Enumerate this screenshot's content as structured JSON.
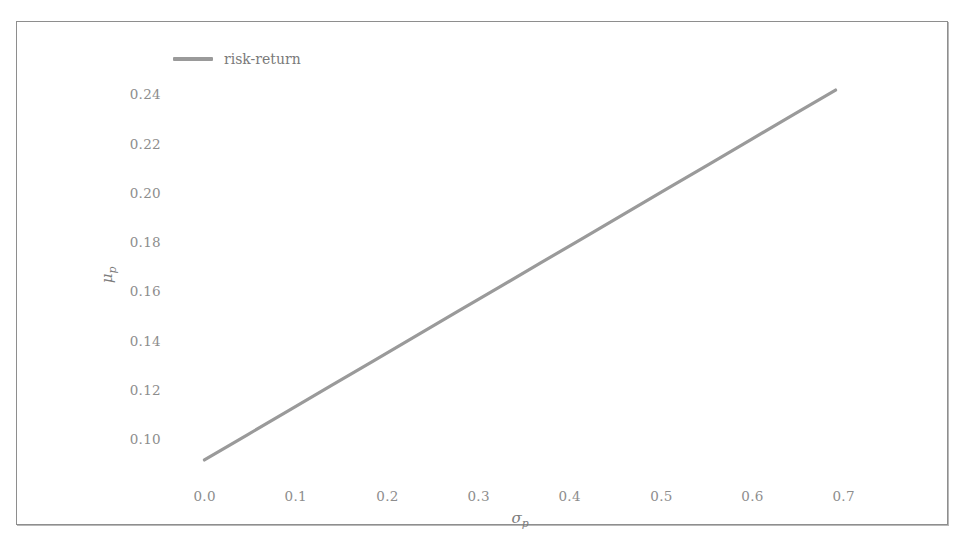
{
  "figure": {
    "background_color": "#ffffff",
    "frame_color": "#8e8e8e"
  },
  "chart_data": {
    "type": "line",
    "title": "",
    "xlabel": "σ",
    "xlabel_sub": "p",
    "ylabel": "μ",
    "ylabel_sub": "p",
    "xlim": [
      -0.035,
      0.785
    ],
    "ylim": [
      0.0935,
      0.2565
    ],
    "xticks": [
      0.0,
      0.1,
      0.2,
      0.3,
      0.4,
      0.5,
      0.6,
      0.7
    ],
    "xticklabels": [
      "0.0",
      "0.1",
      "0.2",
      "0.3",
      "0.4",
      "0.5",
      "0.6",
      "0.7"
    ],
    "yticks": [
      0.1,
      0.12,
      0.14,
      0.16,
      0.18,
      0.2,
      0.22,
      0.24
    ],
    "yticklabels": [
      "0.10",
      "0.12",
      "0.14",
      "0.16",
      "0.18",
      "0.20",
      "0.22",
      "0.24"
    ],
    "grid": false,
    "spines": false,
    "legend_position": "upper left",
    "tick_label_color": "#8d8d8d",
    "axis_label_color": "#7d7d7d",
    "series": [
      {
        "name": "risk-return",
        "color": "#9a9a9a",
        "linewidth": 3.2,
        "x": [
          0.0,
          0.05,
          0.1,
          0.15,
          0.2,
          0.25,
          0.3,
          0.35,
          0.4,
          0.45,
          0.5,
          0.55,
          0.6,
          0.65,
          0.7,
          0.75
        ],
        "y": [
          0.1,
          0.11,
          0.12,
          0.13,
          0.14,
          0.15,
          0.16,
          0.17,
          0.18,
          0.19,
          0.2,
          0.21,
          0.22,
          0.23,
          0.24,
          0.25
        ]
      }
    ]
  },
  "legend": {
    "items": [
      {
        "label": "risk-return",
        "color": "#9a9a9a"
      }
    ]
  }
}
